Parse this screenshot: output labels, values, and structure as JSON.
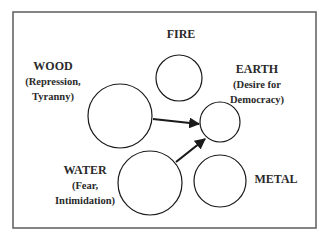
{
  "diagram": {
    "elements": [
      {
        "id": "fire",
        "label": "FIRE",
        "sub": [],
        "circle": {
          "cx": 179,
          "cy": 78,
          "r": 23
        },
        "text": {
          "x": 181,
          "y": 38
        }
      },
      {
        "id": "wood",
        "label": "WOOD",
        "sub": [
          "(Repression,",
          "Tyranny)"
        ],
        "circle": {
          "cx": 120,
          "cy": 116,
          "r": 32
        },
        "text": {
          "x": 53,
          "y": 70
        }
      },
      {
        "id": "earth",
        "label": "EARTH",
        "sub": [
          "(Desire for",
          "Democracy)"
        ],
        "circle": {
          "cx": 220,
          "cy": 122,
          "r": 20
        },
        "text": {
          "x": 257,
          "y": 73
        }
      },
      {
        "id": "water",
        "label": "WATER",
        "sub": [
          "(Fear,",
          "Intimidation)"
        ],
        "circle": {
          "cx": 150,
          "cy": 183,
          "r": 32
        },
        "text": {
          "x": 85,
          "y": 174
        }
      },
      {
        "id": "metal",
        "label": "METAL",
        "sub": [],
        "circle": {
          "cx": 220,
          "cy": 181,
          "r": 26
        },
        "text": {
          "x": 276,
          "y": 183
        }
      }
    ],
    "arrows": [
      {
        "from": "wood",
        "to": "earth",
        "x1": 153,
        "y1": 119,
        "x2": 199,
        "y2": 124
      },
      {
        "from": "water",
        "to": "earth",
        "x1": 176,
        "y1": 162,
        "x2": 205,
        "y2": 139
      }
    ],
    "frame": {
      "x": 13,
      "y": 12,
      "w": 303,
      "h": 216,
      "color": "#666666"
    },
    "stroke_color": "#1a1a1a"
  }
}
